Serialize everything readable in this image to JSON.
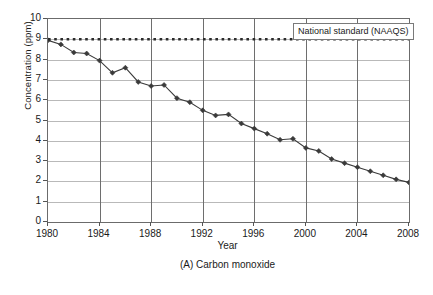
{
  "chart_data": {
    "type": "line",
    "title": "",
    "caption": "(A) Carbon monoxide",
    "xlabel": "Year",
    "ylabel": "Concentration (ppm)",
    "xlim": [
      1980,
      2008
    ],
    "ylim": [
      0,
      10
    ],
    "ytick_step": 1,
    "xtick_step": 4,
    "grid": "horizontal-and-vertical",
    "legend_position": "top-right-inside",
    "x": [
      1980,
      1981,
      1982,
      1983,
      1984,
      1985,
      1986,
      1987,
      1988,
      1989,
      1990,
      1991,
      1992,
      1993,
      1994,
      1995,
      1996,
      1997,
      1998,
      1999,
      2000,
      2001,
      2002,
      2003,
      2004,
      2005,
      2006,
      2007,
      2008
    ],
    "series": [
      {
        "name": "Carbon monoxide concentration",
        "style": "line-with-diamond-markers",
        "color": "#3a3a3a",
        "values": [
          8.95,
          8.75,
          8.35,
          8.3,
          7.95,
          7.35,
          7.6,
          6.9,
          6.7,
          6.75,
          6.1,
          5.9,
          5.5,
          5.25,
          5.3,
          4.85,
          4.6,
          4.35,
          4.05,
          4.1,
          3.65,
          3.5,
          3.1,
          2.9,
          2.7,
          2.5,
          2.3,
          2.1,
          1.95
        ]
      },
      {
        "name": "National standard (NAAQS)",
        "style": "dotted-horizontal-line",
        "color": "#2b2b2b",
        "constant_value": 9
      }
    ],
    "ytick_labels": [
      "10",
      "9",
      "8",
      "7",
      "6",
      "5",
      "4",
      "3",
      "2",
      "1",
      "0"
    ],
    "xtick_labels": [
      "1980",
      "1984",
      "1988",
      "1992",
      "1996",
      "2000",
      "2004",
      "2008"
    ],
    "annotations": [
      {
        "name": "naaqs-legend",
        "text": "National standard (NAAQS)"
      }
    ]
  },
  "legend": {
    "naaqs_label": "National standard (NAAQS)"
  },
  "axes": {
    "y_title": "Concentration (ppm)",
    "x_title": "Year"
  },
  "caption": {
    "text": "(A) Carbon monoxide"
  }
}
